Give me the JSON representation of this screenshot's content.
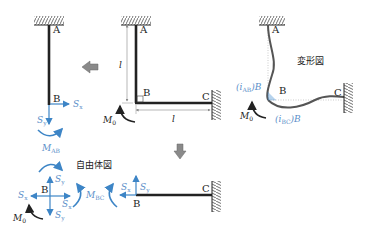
{
  "colors": {
    "member": "#222222",
    "force_blue": "#3d85c6",
    "label_blue": "#5b8fc9",
    "arrow_gray": "#8a8a8a",
    "deformed": "#555555"
  },
  "main_frame": {
    "nodes": {
      "A": "A",
      "B": "B",
      "C": "C"
    },
    "length_vertical": "l",
    "length_horizontal": "l",
    "moment": "M",
    "moment_sub": "0"
  },
  "deformed": {
    "title": "変形図",
    "nodes": {
      "A": "A",
      "B": "B",
      "C": "C"
    },
    "rot_ab": "(i",
    "rot_ab_sub": "AB",
    "rot_ab_tail": ")B",
    "rot_bc": "(i",
    "rot_bc_sub": "BC",
    "rot_bc_tail": ")B",
    "moment": "M",
    "moment_sub": "0"
  },
  "member_ab": {
    "nodes": {
      "A": "A",
      "B": "B"
    },
    "sx": "S",
    "sx_sub": "x",
    "sy": "S",
    "sy_sub": "y",
    "moment": "M",
    "moment_sub": "AB"
  },
  "free_body": {
    "title": "自由体図",
    "node": "B",
    "sx_left": "S",
    "sx_left_sub": "x",
    "sx_right": "S",
    "sx_right_sub": "x",
    "sy_up": "S",
    "sy_up_sub": "y",
    "sy_down": "S",
    "sy_down_sub": "y",
    "moment_bc": "M",
    "moment_bc_sub": "BC",
    "moment0": "M",
    "moment0_sub": "0"
  },
  "member_bc": {
    "nodes": {
      "B": "B",
      "C": "C"
    },
    "sx": "S",
    "sx_sub": "x",
    "sy": "S",
    "sy_sub": "y"
  }
}
